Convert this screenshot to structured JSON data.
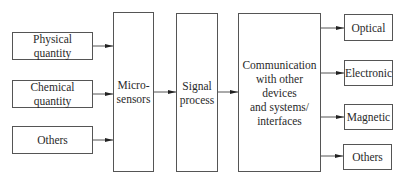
{
  "diagram": {
    "inputs": [
      {
        "label": "Physical quantity"
      },
      {
        "label": "Chemical quantity"
      },
      {
        "label": "Others"
      }
    ],
    "stages": [
      {
        "label": "Micro-\nsensors"
      },
      {
        "label": "Signal\nprocess"
      },
      {
        "label": "Communication\nwith other devices\nand systems/\ninterfaces"
      }
    ],
    "outputs": [
      {
        "label": "Optical"
      },
      {
        "label": "Electronic"
      },
      {
        "label": "Magnetic"
      },
      {
        "label": "Others"
      }
    ],
    "colors": {
      "line": "#555555",
      "arrow": "#222222",
      "text": "#2a2a2a"
    }
  }
}
